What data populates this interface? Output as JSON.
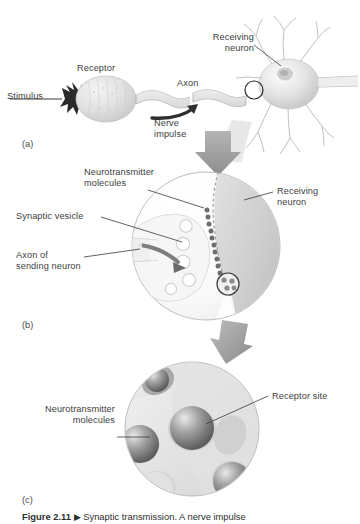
{
  "figure": {
    "caption_label": "Figure 2.11",
    "caption_marker": "▶",
    "caption_text": "Synaptic transmission. A nerve impulse",
    "background_color": "#ffffff"
  },
  "panels": [
    {
      "letter": "(a)",
      "name": "neuron-overview",
      "labels": [
        {
          "name": "stimulus",
          "text": "Stimulus"
        },
        {
          "name": "receptor",
          "text": "Receptor"
        },
        {
          "name": "axon",
          "text": "Axon"
        },
        {
          "name": "nerve-impulse",
          "text": "Nerve\nimpulse"
        },
        {
          "name": "receiving-neuron",
          "text": "Receiving\nneuron"
        }
      ]
    },
    {
      "letter": "(b)",
      "name": "synapse-closeup",
      "labels": [
        {
          "name": "neurotransmitter-molecules",
          "text": "Neurotransmitter\nmolecules"
        },
        {
          "name": "synaptic-vesicle",
          "text": "Synaptic vesicle"
        },
        {
          "name": "axon-of-sending-neuron",
          "text": "Axon of\nsending neuron"
        },
        {
          "name": "receiving-neuron",
          "text": "Receiving\nneuron"
        }
      ]
    },
    {
      "letter": "(c)",
      "name": "receptor-site-closeup",
      "labels": [
        {
          "name": "neurotransmitter-molecules",
          "text": "Neurotransmitter\nmolecules"
        },
        {
          "name": "receptor-site",
          "text": "Receptor site"
        }
      ]
    }
  ],
  "colors": {
    "line": "#3a3a3a",
    "arrow_gray": "#9a9a9a",
    "molecule_dark": "#6e6e6e",
    "cell_light": "#ededed",
    "cell_mid": "#d8d8d8"
  }
}
